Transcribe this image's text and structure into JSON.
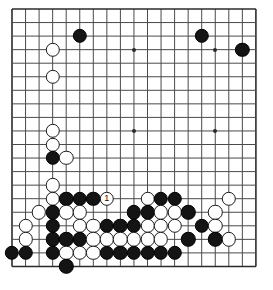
{
  "diagram": {
    "kind": "go-board-diagram",
    "board": {
      "columns": 19,
      "rows": 20,
      "origin_x": 12,
      "origin_y": 9,
      "spacing": 13.55,
      "line_color": "#4a4a4a",
      "border_color": "#2b2b2b",
      "background_color": "#ffffff",
      "stone_radius": 7.2,
      "visible_left_edge": true,
      "visible_right_edge": true,
      "visible_top_edge": true,
      "visible_bottom_edge": true
    },
    "star_points": [
      {
        "col": 10,
        "row": 4
      },
      {
        "col": 16,
        "row": 4
      },
      {
        "col": 10,
        "row": 10
      },
      {
        "col": 16,
        "row": 10
      }
    ],
    "move_label": "1",
    "stones": [
      {
        "color": "black",
        "col": 6,
        "row": 3
      },
      {
        "color": "black",
        "col": 15,
        "row": 3
      },
      {
        "color": "white",
        "col": 4,
        "row": 4
      },
      {
        "color": "black",
        "col": 18,
        "row": 4
      },
      {
        "color": "white",
        "col": 4,
        "row": 6
      },
      {
        "color": "white",
        "col": 4,
        "row": 10
      },
      {
        "color": "white",
        "col": 4,
        "row": 11
      },
      {
        "color": "black",
        "col": 4,
        "row": 12
      },
      {
        "color": "white",
        "col": 5,
        "row": 12
      },
      {
        "color": "white",
        "col": 4,
        "row": 14
      },
      {
        "color": "white",
        "col": 4,
        "row": 15
      },
      {
        "color": "black",
        "col": 5,
        "row": 15
      },
      {
        "color": "black",
        "col": 6,
        "row": 15
      },
      {
        "color": "black",
        "col": 7,
        "row": 15
      },
      {
        "color": "white",
        "col": 8,
        "row": 15,
        "label": "1"
      },
      {
        "color": "white",
        "col": 11,
        "row": 15
      },
      {
        "color": "black",
        "col": 12,
        "row": 15
      },
      {
        "color": "black",
        "col": 13,
        "row": 15
      },
      {
        "color": "white",
        "col": 17,
        "row": 15
      },
      {
        "color": "white",
        "col": 3,
        "row": 16
      },
      {
        "color": "black",
        "col": 4,
        "row": 16
      },
      {
        "color": "white",
        "col": 5,
        "row": 16
      },
      {
        "color": "white",
        "col": 6,
        "row": 16
      },
      {
        "color": "black",
        "col": 10,
        "row": 16
      },
      {
        "color": "black",
        "col": 11,
        "row": 16
      },
      {
        "color": "white",
        "col": 12,
        "row": 16
      },
      {
        "color": "white",
        "col": 13,
        "row": 16
      },
      {
        "color": "black",
        "col": 14,
        "row": 16
      },
      {
        "color": "white",
        "col": 16,
        "row": 16
      },
      {
        "color": "white",
        "col": 2,
        "row": 17
      },
      {
        "color": "black",
        "col": 4,
        "row": 17
      },
      {
        "color": "white",
        "col": 6,
        "row": 17
      },
      {
        "color": "white",
        "col": 7,
        "row": 17
      },
      {
        "color": "black",
        "col": 8,
        "row": 17
      },
      {
        "color": "black",
        "col": 9,
        "row": 17
      },
      {
        "color": "black",
        "col": 10,
        "row": 17
      },
      {
        "color": "white",
        "col": 11,
        "row": 17
      },
      {
        "color": "white",
        "col": 12,
        "row": 17
      },
      {
        "color": "white",
        "col": 13,
        "row": 17
      },
      {
        "color": "black",
        "col": 15,
        "row": 17
      },
      {
        "color": "white",
        "col": 16,
        "row": 17
      },
      {
        "color": "white",
        "col": 2,
        "row": 18
      },
      {
        "color": "black",
        "col": 4,
        "row": 18
      },
      {
        "color": "black",
        "col": 5,
        "row": 18
      },
      {
        "color": "black",
        "col": 6,
        "row": 18
      },
      {
        "color": "white",
        "col": 7,
        "row": 18
      },
      {
        "color": "white",
        "col": 8,
        "row": 18
      },
      {
        "color": "white",
        "col": 9,
        "row": 18
      },
      {
        "color": "white",
        "col": 10,
        "row": 18
      },
      {
        "color": "white",
        "col": 11,
        "row": 18
      },
      {
        "color": "white",
        "col": 12,
        "row": 18
      },
      {
        "color": "black",
        "col": 14,
        "row": 18
      },
      {
        "color": "black",
        "col": 16,
        "row": 18
      },
      {
        "color": "white",
        "col": 17,
        "row": 18
      },
      {
        "color": "black",
        "col": 1,
        "row": 19
      },
      {
        "color": "black",
        "col": 2,
        "row": 19
      },
      {
        "color": "black",
        "col": 4,
        "row": 19
      },
      {
        "color": "white",
        "col": 5,
        "row": 19
      },
      {
        "color": "white",
        "col": 6,
        "row": 19
      },
      {
        "color": "white",
        "col": 7,
        "row": 19
      },
      {
        "color": "black",
        "col": 8,
        "row": 19
      },
      {
        "color": "black",
        "col": 9,
        "row": 19
      },
      {
        "color": "black",
        "col": 10,
        "row": 19
      },
      {
        "color": "black",
        "col": 11,
        "row": 19
      },
      {
        "color": "black",
        "col": 12,
        "row": 19
      },
      {
        "color": "black",
        "col": 13,
        "row": 19
      },
      {
        "color": "black",
        "col": 5,
        "row": 20
      }
    ]
  }
}
